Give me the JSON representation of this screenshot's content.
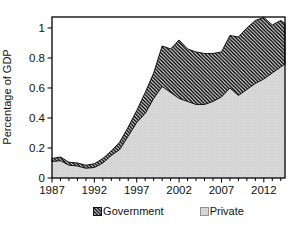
{
  "figure": {
    "ylabel": "Percentage of GDP",
    "colors": {
      "axis": "#000000",
      "text": "#111111",
      "government_hatch_line": "#000000",
      "government_hatch_bg": "#ffffff",
      "private_fill": "#dcdcdc",
      "private_dot": "#c2c2c2"
    }
  },
  "legend": {
    "government_label": "Government",
    "private_label": "Private"
  },
  "chart_data": {
    "type": "area",
    "stacked": true,
    "title": "",
    "xlabel": "",
    "ylabel": "Percentage of GDP",
    "legend_position": "bottom",
    "grid": false,
    "xlim": [
      1987,
      2014.5
    ],
    "ylim": [
      0,
      1.073
    ],
    "yticks": [
      0,
      0.2,
      0.4,
      0.6,
      0.8,
      1
    ],
    "ytick_labels": [
      "0",
      "0.2",
      "0.4",
      "0.6",
      "0.8",
      "1"
    ],
    "xticks_major": [
      1987,
      1992,
      1997,
      2002,
      2007,
      2012
    ],
    "xtick_labels": [
      "1987",
      "1992",
      "1997",
      "2002",
      "2007",
      "2012"
    ],
    "xticks_all": [
      1987,
      1988,
      1989,
      1990,
      1991,
      1992,
      1993,
      1994,
      1995,
      1996,
      1997,
      1998,
      1999,
      2000,
      2001,
      2002,
      2003,
      2004,
      2005,
      2006,
      2007,
      2008,
      2009,
      2010,
      2011,
      2012,
      2013,
      2014
    ],
    "x": [
      1987,
      1988,
      1989,
      1990,
      1991,
      1992,
      1993,
      1994,
      1995,
      1996,
      1997,
      1998,
      1999,
      2000,
      2001,
      2002,
      2003,
      2004,
      2005,
      2006,
      2007,
      2008,
      2009,
      2010,
      2011,
      2012,
      2013,
      2014,
      2014.5
    ],
    "series": [
      {
        "name": "Private",
        "pattern": "dotted-gray",
        "values": [
          0.11,
          0.115,
          0.085,
          0.08,
          0.065,
          0.07,
          0.1,
          0.15,
          0.19,
          0.28,
          0.37,
          0.43,
          0.53,
          0.61,
          0.57,
          0.53,
          0.51,
          0.49,
          0.49,
          0.51,
          0.54,
          0.6,
          0.55,
          0.59,
          0.63,
          0.66,
          0.7,
          0.74,
          0.76
        ]
      },
      {
        "name": "Government",
        "pattern": "diagonal-hatch",
        "values": [
          0.02,
          0.025,
          0.02,
          0.02,
          0.02,
          0.025,
          0.03,
          0.03,
          0.05,
          0.06,
          0.08,
          0.14,
          0.17,
          0.27,
          0.29,
          0.39,
          0.35,
          0.35,
          0.34,
          0.32,
          0.3,
          0.35,
          0.39,
          0.41,
          0.42,
          0.41,
          0.32,
          0.31,
          0.27
        ]
      }
    ],
    "stacked_totals": [
      0.13,
      0.14,
      0.105,
      0.1,
      0.085,
      0.095,
      0.13,
      0.18,
      0.24,
      0.34,
      0.45,
      0.57,
      0.7,
      0.88,
      0.86,
      0.92,
      0.86,
      0.84,
      0.83,
      0.83,
      0.84,
      0.95,
      0.94,
      1.0,
      1.05,
      1.07,
      1.02,
      1.05,
      1.03
    ]
  }
}
